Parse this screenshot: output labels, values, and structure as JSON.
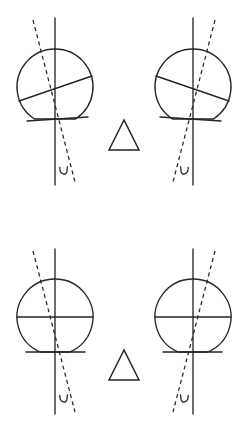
{
  "canvas": {
    "width": 248,
    "height": 424,
    "background": "#ffffff",
    "stroke_color": "#262626"
  },
  "figure": {
    "title": "",
    "type": "geometric-line-diagram",
    "layout": "2x2 grid of circle diagrams with two triangles in the center column",
    "panel_count": 4,
    "triangle_count": 2
  },
  "panels": [
    {
      "id": "top-left",
      "name": "circle-diagram-top-left",
      "circle": {
        "cx": 55,
        "cy": 87,
        "r": 38
      },
      "vertical_axis": {
        "x1": 55,
        "y1": 18,
        "x2": 55,
        "y2": 185,
        "style": "solid"
      },
      "dashed_axis": {
        "x1": 33,
        "y1": 20,
        "x2": 75,
        "y2": 182,
        "style": "dashed"
      },
      "chord": {
        "x1": 19,
        "y1": 101,
        "x2": 92,
        "y2": 76,
        "label": "tilted-diameter"
      },
      "bottom_cut": {
        "x1": 27,
        "y1": 121,
        "x2": 88,
        "y2": 117,
        "label": "flat-bottom-chord"
      },
      "curl_marker": {
        "cx": 64,
        "cy": 172,
        "mirrored": false
      },
      "mirrored": false
    },
    {
      "id": "top-right",
      "name": "circle-diagram-top-right",
      "circle": {
        "cx": 193,
        "cy": 87,
        "r": 38
      },
      "vertical_axis": {
        "x1": 193,
        "y1": 18,
        "x2": 193,
        "y2": 185,
        "style": "solid"
      },
      "dashed_axis": {
        "x1": 215,
        "y1": 20,
        "x2": 173,
        "y2": 182,
        "style": "dashed"
      },
      "chord": {
        "x1": 229,
        "y1": 101,
        "x2": 156,
        "y2": 76,
        "label": "tilted-diameter"
      },
      "bottom_cut": {
        "x1": 221,
        "y1": 121,
        "x2": 160,
        "y2": 117,
        "label": "flat-bottom-chord"
      },
      "curl_marker": {
        "cx": 184,
        "cy": 172,
        "mirrored": true
      },
      "mirrored": true
    },
    {
      "id": "bottom-left",
      "name": "circle-diagram-bottom-left",
      "circle": {
        "cx": 55,
        "cy": 317,
        "r": 38
      },
      "vertical_axis": {
        "x1": 55,
        "y1": 249,
        "x2": 55,
        "y2": 414,
        "style": "solid"
      },
      "dashed_axis": {
        "x1": 33,
        "y1": 251,
        "x2": 75,
        "y2": 412,
        "style": "dashed"
      },
      "chord": {
        "x1": 17,
        "y1": 317,
        "x2": 93,
        "y2": 317,
        "label": "horizontal-diameter"
      },
      "bottom_cut": {
        "x1": 26,
        "y1": 352,
        "x2": 85,
        "y2": 352,
        "label": "flat-bottom-chord"
      },
      "curl_marker": {
        "cx": 64,
        "cy": 400,
        "mirrored": false
      },
      "mirrored": false
    },
    {
      "id": "bottom-right",
      "name": "circle-diagram-bottom-right",
      "circle": {
        "cx": 193,
        "cy": 317,
        "r": 38
      },
      "vertical_axis": {
        "x1": 193,
        "y1": 249,
        "x2": 193,
        "y2": 414,
        "style": "solid"
      },
      "dashed_axis": {
        "x1": 215,
        "y1": 251,
        "x2": 173,
        "y2": 412,
        "style": "dashed"
      },
      "chord": {
        "x1": 231,
        "y1": 317,
        "x2": 155,
        "y2": 317,
        "label": "horizontal-diameter"
      },
      "bottom_cut": {
        "x1": 222,
        "y1": 352,
        "x2": 163,
        "y2": 352,
        "label": "flat-bottom-chord"
      },
      "curl_marker": {
        "cx": 184,
        "cy": 400,
        "mirrored": true
      },
      "mirrored": true
    }
  ],
  "triangles": [
    {
      "id": "triangle-top",
      "name": "triangle-center-top",
      "apex": {
        "x": 124,
        "y": 120
      },
      "left": {
        "x": 109,
        "y": 150
      },
      "right": {
        "x": 139,
        "y": 150
      },
      "orientation": "pointing-up"
    },
    {
      "id": "triangle-bottom",
      "name": "triangle-center-bottom",
      "apex": {
        "x": 124,
        "y": 350
      },
      "left": {
        "x": 109,
        "y": 380
      },
      "right": {
        "x": 139,
        "y": 380
      },
      "orientation": "pointing-up"
    }
  ]
}
